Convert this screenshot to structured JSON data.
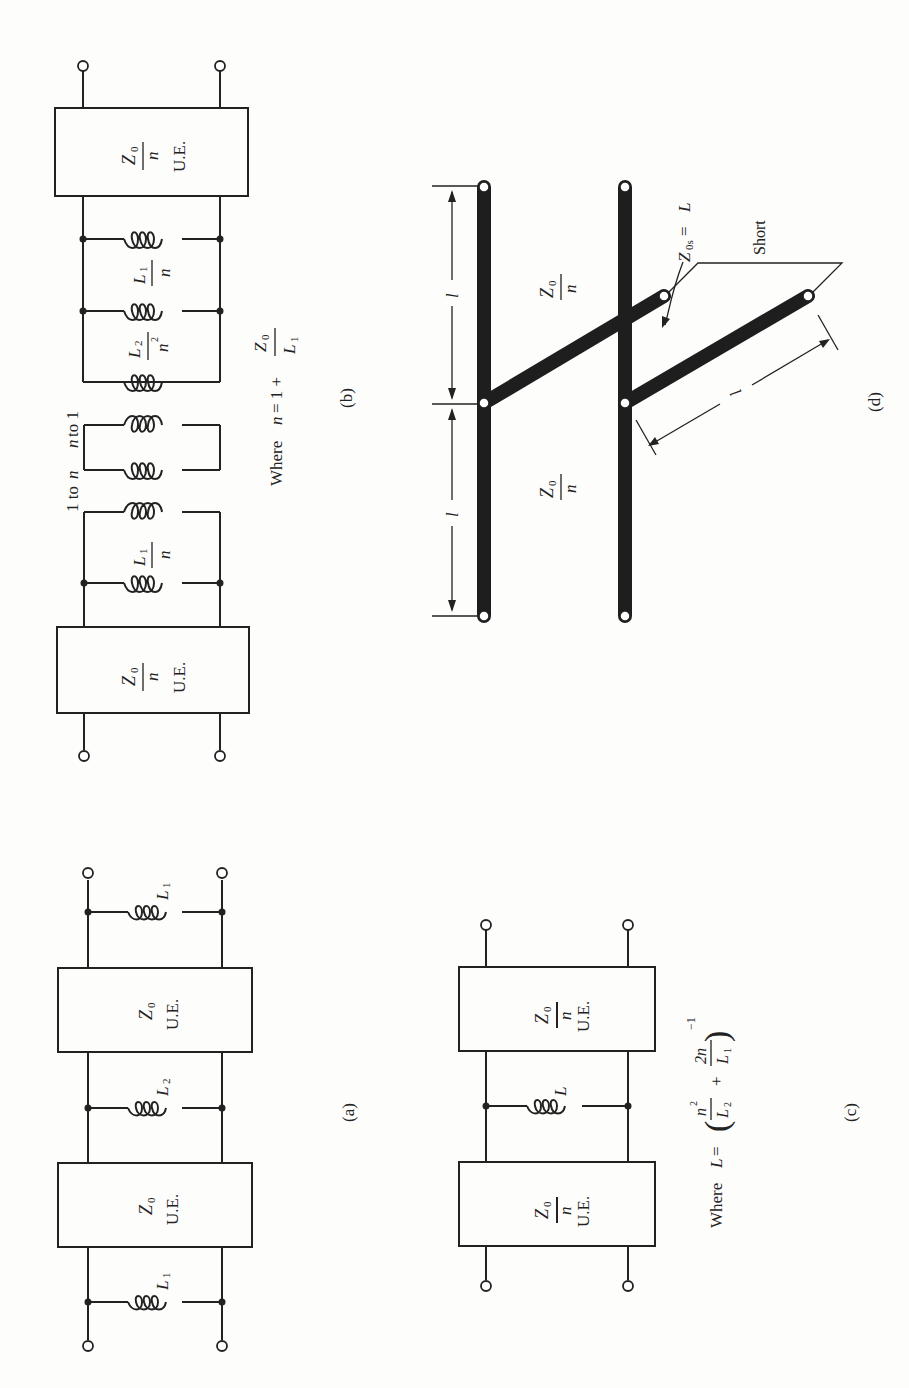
{
  "figure": {
    "orientation": "rotated 90° counter-clockwise",
    "panels": {
      "a": {
        "caption": "(a)",
        "elements": [
          {
            "type": "shunt-inductor",
            "label": "L",
            "sub": "1"
          },
          {
            "type": "unit-element",
            "impedance": "Z",
            "impedance_sub": "0",
            "tag": "U.E."
          },
          {
            "type": "shunt-inductor",
            "label": "L",
            "sub": "2"
          },
          {
            "type": "unit-element",
            "impedance": "Z",
            "impedance_sub": "0",
            "tag": "U.E."
          },
          {
            "type": "shunt-inductor",
            "label": "L",
            "sub": "1"
          }
        ]
      },
      "b": {
        "caption": "(b)",
        "ue_label": {
          "num": "Z",
          "num_sub": "0",
          "den": "n",
          "tag": "U.E."
        },
        "l1_label": {
          "num": "L",
          "num_sub": "1",
          "den": "n"
        },
        "l2_label": {
          "num": "L",
          "num_sub": "2",
          "den": "n",
          "den_sup": "2"
        },
        "transformer_left": "1 to ",
        "transformer_left_var": "n",
        "transformer_right_var": "n",
        "transformer_right": " to 1",
        "where": {
          "prefix": "Where ",
          "var": "n",
          "eq": " = 1 + ",
          "frac_num": "Z",
          "frac_num_sub": "0",
          "frac_den": "L",
          "frac_den_sub": "1"
        }
      },
      "c": {
        "caption": "(c)",
        "ue_label": {
          "num": "Z",
          "num_sub": "0",
          "den": "n",
          "tag": "U.E."
        },
        "inductor_label": "L",
        "where": {
          "prefix": "Where ",
          "var": "L",
          "eq": " = ",
          "term1_num": "n",
          "term1_num_sup": "2",
          "term1_den": "L",
          "term1_den_sub": "2",
          "plus": "+",
          "term2_num": "2n",
          "term2_den": "L",
          "term2_den_sub": "1",
          "exponent": "−1"
        }
      },
      "d": {
        "caption": "(d)",
        "line_label": {
          "num": "Z",
          "num_sub": "0",
          "den": "n"
        },
        "stub_label": {
          "var": "Z",
          "sub": "0s",
          "eq": " = ",
          "value": "L"
        },
        "short_label": "Short",
        "length_label": "l"
      }
    }
  }
}
